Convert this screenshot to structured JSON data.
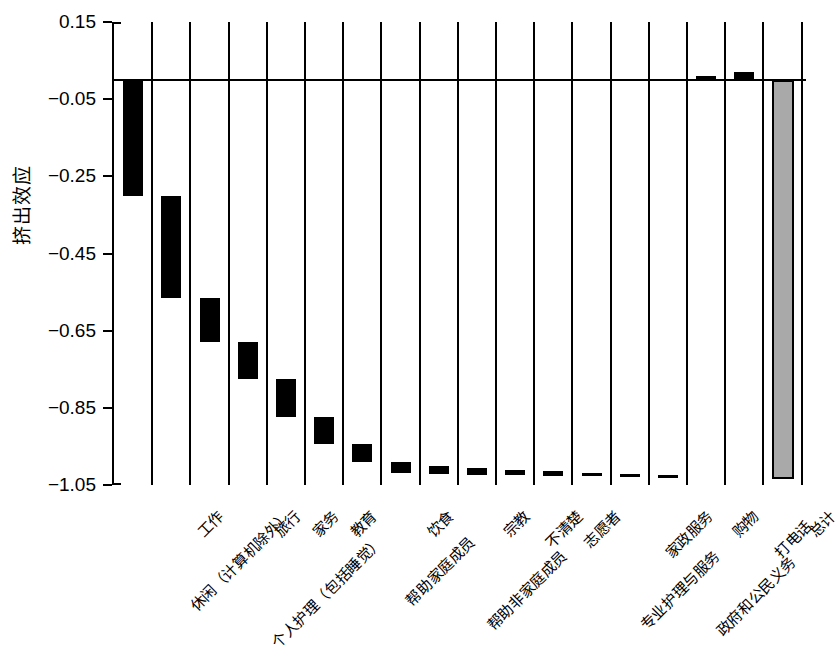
{
  "chart_data": {
    "type": "bar",
    "subtype": "waterfall",
    "title": "",
    "xlabel": "",
    "ylabel": "挤出效应",
    "ylim": [
      -1.05,
      0.15
    ],
    "ytick_labels": [
      "0.15",
      "−0.05",
      "−0.25",
      "−0.45",
      "−0.65",
      "−0.85",
      "−1.05"
    ],
    "ytick_values": [
      0.15,
      -0.05,
      -0.25,
      -0.45,
      -0.65,
      -0.85,
      -1.05
    ],
    "grid": "vertical category separators only",
    "legend": "none",
    "zero_reference_line": 0,
    "categories": [
      "休闲（计算机除外）",
      "工作",
      "个人护理（包括睡觉）",
      "旅行",
      "家务",
      "教育",
      "帮助家庭成员",
      "饮食",
      "帮助非家庭成员",
      "宗教",
      "不清楚",
      "志愿者",
      "专业护理与服务",
      "家政服务",
      "政府和公民义务",
      "购物",
      "打电话",
      "总计"
    ],
    "values": [
      -0.3,
      -0.265,
      -0.115,
      -0.095,
      -0.1,
      -0.07,
      -0.045,
      -0.03,
      -0.022,
      -0.018,
      -0.013,
      -0.011,
      -0.01,
      -0.008,
      -0.008,
      0.01,
      0.02,
      -1.035
    ],
    "cumulative_start": [
      0.0,
      -0.3,
      -0.565,
      -0.68,
      -0.775,
      -0.875,
      -0.945,
      -0.99,
      -1.02,
      -1.042,
      -1.06,
      -1.073,
      -1.084,
      -1.094,
      -1.102,
      -1.11,
      -0.015,
      0.0
    ],
    "cumulative_end": [
      -0.3,
      -0.565,
      -0.68,
      -0.775,
      -0.875,
      -0.945,
      -0.99,
      -1.02,
      -1.042,
      -1.06,
      -1.073,
      -1.084,
      -1.094,
      -1.102,
      -1.11,
      0.01,
      0.02,
      -1.035
    ],
    "bar_colors": {
      "component": "#000000",
      "total_fill": "#a9a9a9",
      "total_edge": "#000000"
    },
    "bars": [
      {
        "category": "休闲（计算机除外）",
        "kind": "component",
        "top": 0.0,
        "bottom": -0.3
      },
      {
        "category": "工作",
        "kind": "component",
        "top": -0.3,
        "bottom": -0.565
      },
      {
        "category": "个人护理（包括睡觉）",
        "kind": "component",
        "top": -0.565,
        "bottom": -0.68
      },
      {
        "category": "旅行",
        "kind": "component",
        "top": -0.68,
        "bottom": -0.775
      },
      {
        "category": "家务",
        "kind": "component",
        "top": -0.775,
        "bottom": -0.875
      },
      {
        "category": "教育",
        "kind": "component",
        "top": -0.875,
        "bottom": -0.945
      },
      {
        "category": "帮助家庭成员",
        "kind": "component",
        "top": -0.945,
        "bottom": -0.99
      },
      {
        "category": "饮食",
        "kind": "component",
        "top": -0.99,
        "bottom": -1.02
      },
      {
        "category": "帮助非家庭成员",
        "kind": "component",
        "top": -1.0,
        "bottom": -1.022
      },
      {
        "category": "宗教",
        "kind": "component",
        "top": -1.005,
        "bottom": -1.023
      },
      {
        "category": "不清楚",
        "kind": "component",
        "top": -1.01,
        "bottom": -1.023
      },
      {
        "category": "志愿者",
        "kind": "component",
        "top": -1.015,
        "bottom": -1.026
      },
      {
        "category": "专业护理与服务",
        "kind": "component",
        "top": -1.018,
        "bottom": -1.028
      },
      {
        "category": "家政服务",
        "kind": "component",
        "top": -1.022,
        "bottom": -1.03
      },
      {
        "category": "政府和公民义务",
        "kind": "component",
        "top": -1.024,
        "bottom": -1.032
      },
      {
        "category": "购物",
        "kind": "component",
        "top": 0.01,
        "bottom": 0.0
      },
      {
        "category": "打电话",
        "kind": "component",
        "top": 0.02,
        "bottom": 0.0
      },
      {
        "category": "总计",
        "kind": "total",
        "top": 0.0,
        "bottom": -1.035
      }
    ]
  },
  "axis": {
    "y_label": "挤出效应",
    "y_ticks": [
      "0.15",
      "−0.05",
      "−0.25",
      "−0.45",
      "−0.65",
      "−0.85",
      "−1.05"
    ]
  },
  "x_axis_labels": [
    "休闲（计算机除外）",
    "工作",
    "个人护理（包括睡觉）",
    "旅行",
    "家务",
    "教育",
    "帮助家庭成员",
    "饮食",
    "帮助非家庭成员",
    "宗教",
    "不清楚",
    "志愿者",
    "专业护理与服务",
    "家政服务",
    "政府和公民义务",
    "购物",
    "打电话",
    "总计"
  ]
}
